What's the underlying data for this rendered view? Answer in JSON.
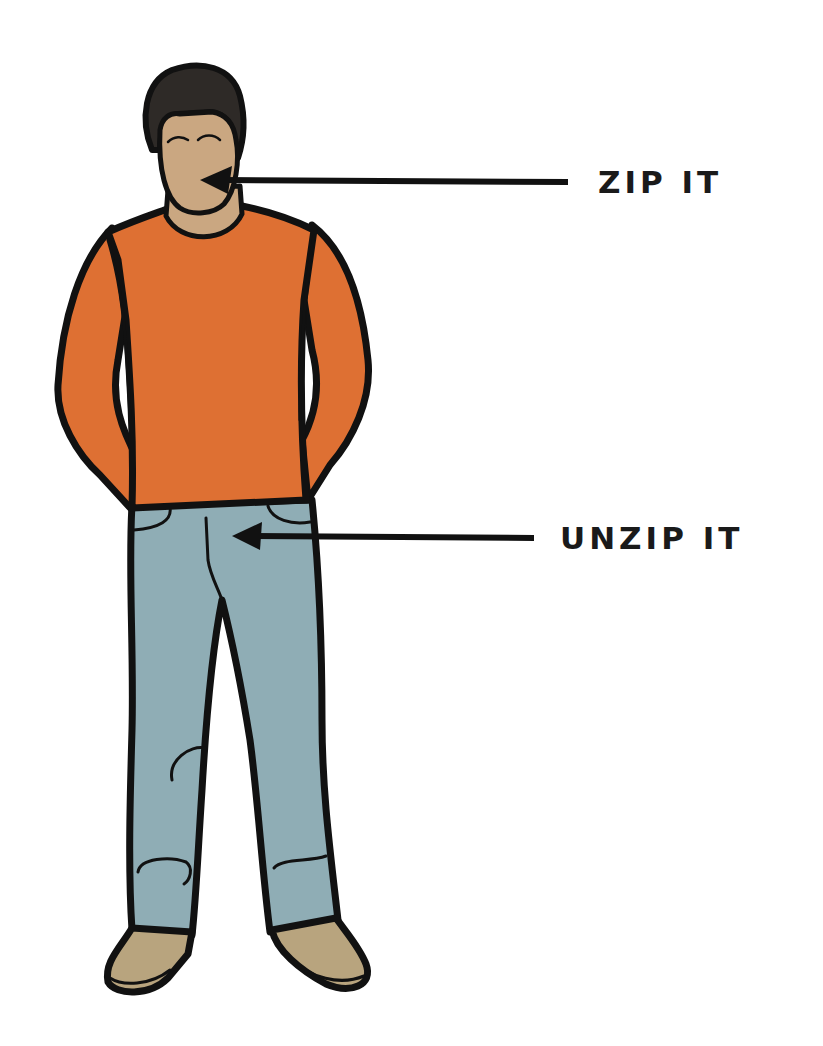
{
  "diagram": {
    "labels": [
      {
        "id": "mouth",
        "text": "ZIP IT",
        "target": "mouth"
      },
      {
        "id": "fly",
        "text": "UNZIP IT",
        "target": "jeans-fly"
      }
    ],
    "colors": {
      "background": "#ffffff",
      "outline": "#111111",
      "skin": "#caa781",
      "hair": "#2e2a27",
      "shirt": "#de7033",
      "jeans": "#8fadb5",
      "shoes": "#b8a47e",
      "text": "#1a1a1a"
    }
  }
}
